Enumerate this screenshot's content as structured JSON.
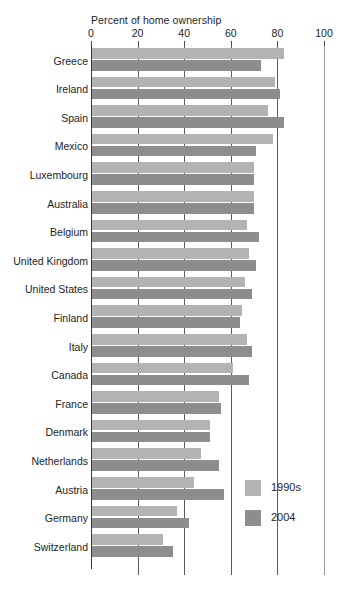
{
  "chart_data": {
    "type": "bar",
    "orientation": "horizontal",
    "title": "",
    "xlabel": "Percent of home ownership",
    "ylabel": "",
    "xlim": [
      0,
      100
    ],
    "xticks": [
      0,
      20,
      40,
      60,
      80,
      100
    ],
    "xtick_labels": [
      "0",
      "20",
      "40",
      "60",
      "80",
      "100"
    ],
    "grid": true,
    "grid_axis": "x",
    "legend_position": "bottom-right",
    "categories": [
      "Greece",
      "Ireland",
      "Spain",
      "Mexico",
      "Luxembourg",
      "Australia",
      "Belgium",
      "United Kingdom",
      "United States",
      "Finland",
      "Italy",
      "Canada",
      "France",
      "Denmark",
      "Netherlands",
      "Austria",
      "Germany",
      "Switzerland"
    ],
    "series": [
      {
        "name": "1990s",
        "color": "#b3b3b3",
        "values": [
          83,
          79,
          76,
          78,
          70,
          70,
          67,
          68,
          66,
          65,
          67,
          61,
          55,
          51,
          47,
          44,
          37,
          31
        ]
      },
      {
        "name": "2004",
        "color": "#8d8d8d",
        "values": [
          73,
          81,
          83,
          71,
          70,
          70,
          72,
          71,
          69,
          64,
          69,
          68,
          56,
          51,
          55,
          57,
          42,
          35
        ]
      }
    ]
  },
  "axis": {
    "title": "Percent of home ownership",
    "ticks": [
      {
        "value": 0,
        "label": "0"
      },
      {
        "value": 20,
        "label": "20"
      },
      {
        "value": 40,
        "label": "40"
      },
      {
        "value": 60,
        "label": "60"
      },
      {
        "value": 80,
        "label": "80"
      },
      {
        "value": 100,
        "label": "100"
      }
    ]
  },
  "legend": {
    "items": [
      {
        "label": "1990s",
        "color": "#b3b3b3"
      },
      {
        "label": "2004",
        "color": "#8d8d8d"
      }
    ]
  },
  "colors": {
    "series_1990s": "#b3b3b3",
    "series_2004": "#8d8d8d",
    "gridline": "#5a5a5a",
    "text": "#1d1d1d",
    "background": "#ffffff"
  }
}
